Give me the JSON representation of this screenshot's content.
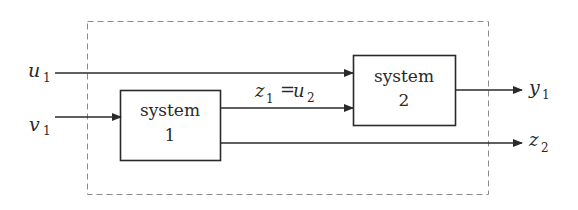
{
  "diagram": {
    "boundary": {
      "style": "dashed",
      "color": "#8a8a8a"
    },
    "blocks": [
      {
        "id": "system1",
        "line1": "system",
        "line2": "1"
      },
      {
        "id": "system2",
        "line1": "system",
        "line2": "2"
      }
    ],
    "signals": {
      "u1": {
        "base": "u",
        "sub": "1"
      },
      "v1": {
        "base": "v",
        "sub": "1"
      },
      "z1u2": {
        "base1": "z",
        "sub1": "1",
        "eq": "=",
        "base2": "u",
        "sub2": "2"
      },
      "y1": {
        "base": "y",
        "sub": "1"
      },
      "z2": {
        "base": "z",
        "sub": "2"
      }
    },
    "edges": [
      {
        "from": "u1",
        "to": "system2"
      },
      {
        "from": "v1",
        "to": "system1"
      },
      {
        "from": "system1",
        "to": "system2",
        "label": "z1=u2"
      },
      {
        "from": "system2",
        "to": "y1"
      },
      {
        "from": "system1",
        "to": "z2"
      }
    ],
    "line_color": "#2a2a2a"
  }
}
